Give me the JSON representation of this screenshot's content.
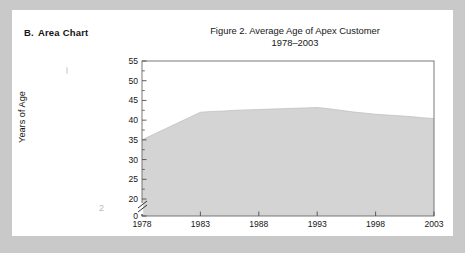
{
  "section": {
    "letter": "B.",
    "label": "Area Chart"
  },
  "artifacts": {
    "page_number": "2"
  },
  "colors": {
    "page_background": "#ffffff",
    "scan_margin": "#c9c9c9",
    "area_fill": "#d4d4d4",
    "area_line": "#bdbdbd",
    "axis": "#5a5a5a",
    "text": "#161616"
  },
  "chart_data": {
    "type": "area",
    "title": "Figure 2.  Average Age of Apex Customer",
    "subtitle": "1978–2003",
    "xlabel": "",
    "ylabel": "Years of Age",
    "grid": false,
    "legend": "none",
    "axis_break": true,
    "axis_break_location": "y-axis between 0 and 20",
    "xlim": [
      1978,
      2003
    ],
    "ylim": [
      0,
      55
    ],
    "yticks": [
      0,
      20,
      25,
      30,
      35,
      40,
      45,
      50,
      55
    ],
    "ytick_labels": [
      "0",
      "20",
      "25",
      "30",
      "35",
      "40",
      "45",
      "50",
      "55"
    ],
    "xticks": [
      1978,
      1983,
      1988,
      1993,
      1998,
      2003
    ],
    "xtick_labels": [
      "1978",
      "1983",
      "1988",
      "1993",
      "1998",
      "2003"
    ],
    "x": [
      1978,
      1979,
      1980,
      1981,
      1982,
      1983,
      1984,
      1985,
      1986,
      1987,
      1988,
      1989,
      1990,
      1991,
      1992,
      1993,
      1994,
      1995,
      1996,
      1997,
      1998,
      1999,
      2000,
      2001,
      2002,
      2003
    ],
    "values": [
      35.0,
      36.4,
      37.8,
      39.2,
      40.6,
      42.0,
      42.2,
      42.3,
      42.5,
      42.6,
      42.7,
      42.8,
      42.9,
      43.0,
      43.1,
      43.2,
      42.9,
      42.5,
      42.1,
      41.8,
      41.5,
      41.3,
      41.1,
      40.9,
      40.6,
      40.4
    ],
    "series": [
      {
        "name": "Average Age of Apex Customer",
        "values": [
          35.0,
          36.4,
          37.8,
          39.2,
          40.6,
          42.0,
          42.2,
          42.3,
          42.5,
          42.6,
          42.7,
          42.8,
          42.9,
          43.0,
          43.1,
          43.2,
          42.9,
          42.5,
          42.1,
          41.8,
          41.5,
          41.3,
          41.1,
          40.9,
          40.6,
          40.4
        ]
      }
    ]
  }
}
